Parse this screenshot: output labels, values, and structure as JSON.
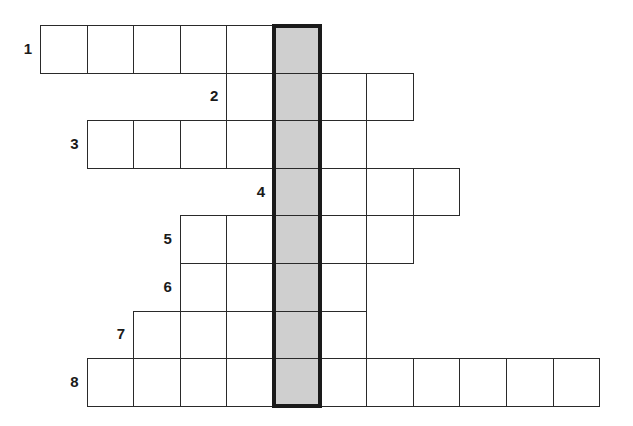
{
  "puzzle": {
    "type": "crossword",
    "colors": {
      "cell_fill": "#ffffff",
      "highlight_fill": "#cfcfcf",
      "line": "#2a2a2a",
      "highlight_border": "#1a1a1a"
    },
    "grid": {
      "origin_x": 40,
      "origin_y": 25,
      "cell_w": 46.6,
      "cell_h": 47.6
    },
    "highlight_column": 5,
    "rows": [
      {
        "number": "1",
        "row": 0,
        "start_col": 0,
        "end_col": 5
      },
      {
        "number": "2",
        "row": 1,
        "start_col": 4,
        "end_col": 7
      },
      {
        "number": "3",
        "row": 2,
        "start_col": 1,
        "end_col": 6
      },
      {
        "number": "4",
        "row": 3,
        "start_col": 5,
        "end_col": 8
      },
      {
        "number": "5",
        "row": 4,
        "start_col": 3,
        "end_col": 7
      },
      {
        "number": "6",
        "row": 5,
        "start_col": 3,
        "end_col": 6
      },
      {
        "number": "7",
        "row": 6,
        "start_col": 2,
        "end_col": 6
      },
      {
        "number": "8",
        "row": 7,
        "start_col": 1,
        "end_col": 11
      }
    ]
  }
}
